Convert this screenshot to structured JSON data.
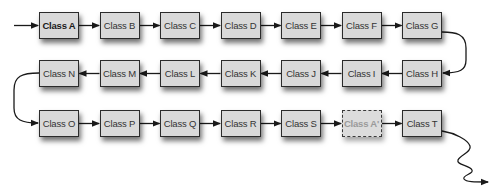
{
  "diagram": {
    "type": "linked-chain",
    "rows": [
      {
        "direction": "left-to-right",
        "nodes": [
          {
            "id": "A",
            "label": "Class A",
            "style": "bold"
          },
          {
            "id": "B",
            "label": "Class B",
            "style": "normal"
          },
          {
            "id": "C",
            "label": "Class C",
            "style": "normal"
          },
          {
            "id": "D",
            "label": "Class D",
            "style": "normal"
          },
          {
            "id": "E",
            "label": "Class E",
            "style": "normal"
          },
          {
            "id": "F",
            "label": "Class F",
            "style": "normal"
          },
          {
            "id": "G",
            "label": "Class G",
            "style": "normal"
          }
        ]
      },
      {
        "direction": "right-to-left",
        "nodes": [
          {
            "id": "N",
            "label": "Class N",
            "style": "normal"
          },
          {
            "id": "M",
            "label": "Class M",
            "style": "normal"
          },
          {
            "id": "L",
            "label": "Class L",
            "style": "normal"
          },
          {
            "id": "K",
            "label": "Class K",
            "style": "normal"
          },
          {
            "id": "J",
            "label": "Class J",
            "style": "normal"
          },
          {
            "id": "I",
            "label": "Class I",
            "style": "normal"
          },
          {
            "id": "H",
            "label": "Class H",
            "style": "normal"
          }
        ]
      },
      {
        "direction": "left-to-right",
        "nodes": [
          {
            "id": "O",
            "label": "Class O",
            "style": "normal"
          },
          {
            "id": "P",
            "label": "Class P",
            "style": "normal"
          },
          {
            "id": "Q",
            "label": "Class Q",
            "style": "normal"
          },
          {
            "id": "R",
            "label": "Class R",
            "style": "normal"
          },
          {
            "id": "S",
            "label": "Class S",
            "style": "normal"
          },
          {
            "id": "A2",
            "label": "Class A'",
            "style": "ghost"
          },
          {
            "id": "T",
            "label": "Class T",
            "style": "normal"
          }
        ]
      }
    ],
    "edges": [
      [
        "start",
        "A"
      ],
      [
        "A",
        "B"
      ],
      [
        "B",
        "C"
      ],
      [
        "C",
        "D"
      ],
      [
        "D",
        "E"
      ],
      [
        "E",
        "F"
      ],
      [
        "F",
        "G"
      ],
      [
        "G",
        "H"
      ],
      [
        "H",
        "I"
      ],
      [
        "I",
        "J"
      ],
      [
        "J",
        "K"
      ],
      [
        "K",
        "L"
      ],
      [
        "L",
        "M"
      ],
      [
        "M",
        "N"
      ],
      [
        "N",
        "O"
      ],
      [
        "O",
        "P"
      ],
      [
        "P",
        "Q"
      ],
      [
        "Q",
        "R"
      ],
      [
        "R",
        "S"
      ],
      [
        "S",
        "A2"
      ],
      [
        "A2",
        "T"
      ],
      [
        "T",
        "continues"
      ]
    ],
    "colors": {
      "node_fill": "#d9d9d9",
      "node_border": "#2b2b2b",
      "edge": "#1a1a1a",
      "ghost_text": "#9a9a9a"
    }
  }
}
